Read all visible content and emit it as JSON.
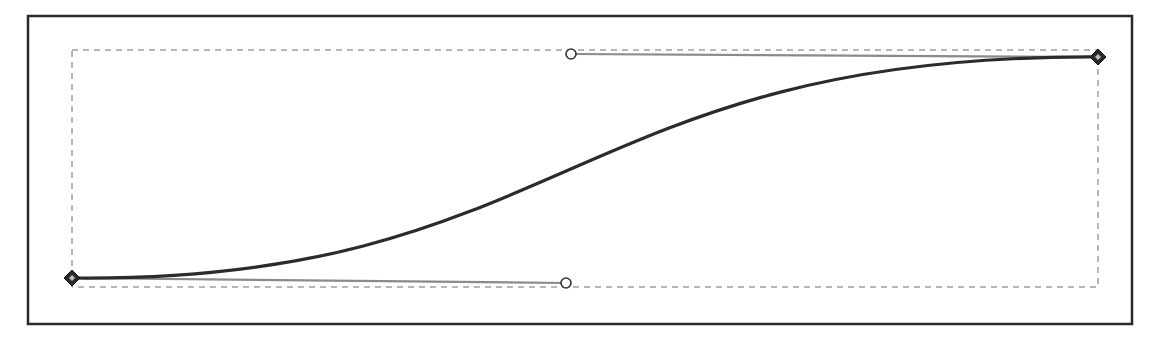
{
  "diagram": {
    "type": "bezier-curve-editor",
    "frame": {
      "x": 28,
      "y": 16,
      "width": 1104,
      "height": 308,
      "stroke": "#2a2a2a"
    },
    "bounding_box": {
      "x": 72,
      "y": 50,
      "width": 1026,
      "height": 237,
      "stroke": "#6e6e6e",
      "style": "dashed"
    },
    "curve": {
      "stroke": "#2b2b2b",
      "start": {
        "x": 72,
        "y": 278
      },
      "control1": {
        "x": 566,
        "y": 283
      },
      "control2": {
        "x": 571,
        "y": 54
      },
      "end": {
        "x": 1098,
        "y": 57
      }
    },
    "nodes": [
      {
        "name": "start-node",
        "x": 72,
        "y": 278,
        "shape": "diamond"
      },
      {
        "name": "end-node",
        "x": 1098,
        "y": 57,
        "shape": "diamond"
      }
    ],
    "handles": [
      {
        "name": "handle-bottom",
        "x": 566,
        "y": 283,
        "shape": "circle"
      },
      {
        "name": "handle-top",
        "x": 571,
        "y": 54,
        "shape": "circle"
      }
    ],
    "handle_line_color": "#8a8a8a"
  }
}
